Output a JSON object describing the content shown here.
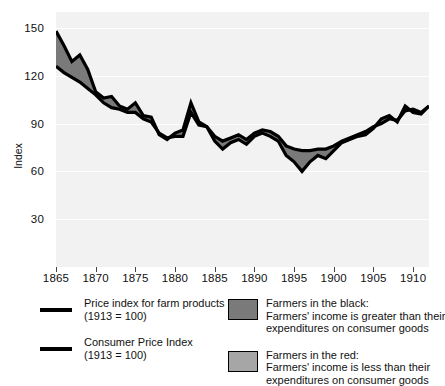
{
  "axes": {
    "y_title": "Index",
    "y_ticks": [
      30,
      60,
      90,
      120,
      150
    ],
    "x_ticks": [
      1865,
      1870,
      1875,
      1880,
      1885,
      1890,
      1895,
      1900,
      1905,
      1910
    ]
  },
  "legend": {
    "left": [
      {
        "marker": "black-line",
        "line1": "Price index for farm products",
        "line2": "(1913 = 100)"
      },
      {
        "marker": "black-line",
        "line1": "Consumer Price Index",
        "line2": "(1913 = 100)"
      }
    ],
    "right": [
      {
        "marker": "dark-gray-box",
        "color": "#7a7a7a",
        "line1": "Farmers in the black:",
        "line2": "Farmers' income is greater than their",
        "line3": "expenditures on consumer goods"
      },
      {
        "marker": "light-gray-box",
        "color": "#a6a6a6",
        "line1": "Farmers in the red:",
        "line2": "Farmers' income is less than their",
        "line3": "expenditures on consumer goods"
      }
    ]
  },
  "colors": {
    "plot_background": "#f2f2f2",
    "gridline": "#ffffff",
    "line": "#000000",
    "band_fill": "#7a7a7a"
  },
  "chart_data": {
    "type": "line",
    "title": "",
    "xlabel": "",
    "ylabel": "Index",
    "xlim": [
      1865,
      1912
    ],
    "ylim": [
      0,
      160
    ],
    "grid": true,
    "legend_position": "below",
    "x": [
      1865,
      1866,
      1867,
      1868,
      1869,
      1870,
      1871,
      1872,
      1873,
      1874,
      1875,
      1876,
      1877,
      1878,
      1879,
      1880,
      1881,
      1882,
      1883,
      1884,
      1885,
      1886,
      1887,
      1888,
      1889,
      1890,
      1891,
      1892,
      1893,
      1894,
      1895,
      1896,
      1897,
      1898,
      1899,
      1900,
      1901,
      1902,
      1903,
      1904,
      1905,
      1906,
      1907,
      1908,
      1909,
      1910,
      1911,
      1912
    ],
    "series": [
      {
        "name": "Price index for farm products (1913 = 100)",
        "values": [
          148,
          139,
          129,
          133,
          124,
          110,
          106,
          107,
          101,
          99,
          103,
          95,
          94,
          83,
          80,
          84,
          86,
          103,
          91,
          88,
          79,
          74,
          78,
          80,
          77,
          82,
          84,
          82,
          79,
          70,
          66,
          60,
          66,
          70,
          68,
          73,
          78,
          80,
          82,
          83,
          87,
          93,
          95,
          91,
          101,
          97,
          96,
          101
        ]
      },
      {
        "name": "Consumer Price Index (1913 = 100)",
        "values": [
          126,
          122,
          119,
          116,
          112,
          108,
          103,
          100,
          99,
          97,
          97,
          93,
          91,
          84,
          81,
          82,
          82,
          97,
          89,
          88,
          82,
          79,
          81,
          83,
          80,
          84,
          86,
          85,
          82,
          76,
          74,
          73,
          73,
          74,
          74,
          76,
          79,
          81,
          83,
          85,
          88,
          90,
          93,
          92,
          98,
          99,
          97,
          101
        ]
      }
    ]
  }
}
